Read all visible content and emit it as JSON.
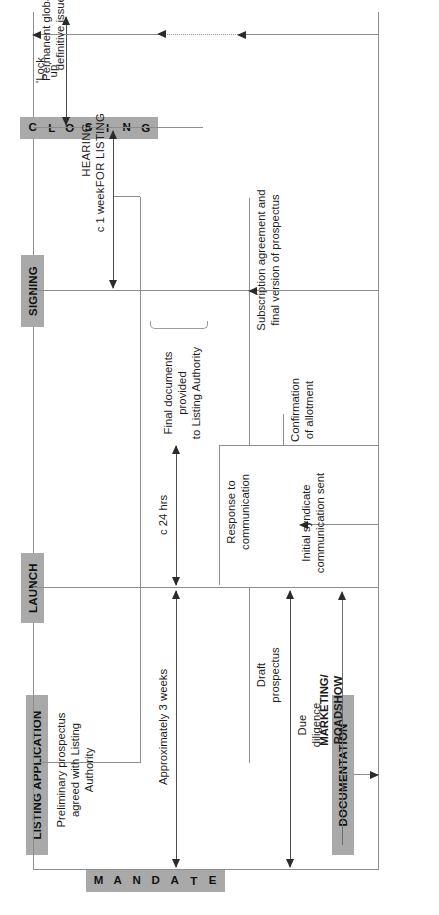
{
  "diagram": {
    "orientation": "rotated-90-ccw",
    "accent_gray": "#a9a9a9",
    "line_gray": "#8d8d8d",
    "phases": [
      {
        "id": "mandate",
        "label": "MANDATE",
        "style": "stacked-letters",
        "letters": [
          "M",
          "A",
          "N",
          "D",
          "A",
          "T",
          "E"
        ]
      },
      {
        "id": "launch",
        "label": "LAUNCH",
        "style": "horizontal"
      },
      {
        "id": "signing",
        "label": "SIGNING",
        "style": "horizontal"
      },
      {
        "id": "closing",
        "label": "CLOSING",
        "style": "stacked-letters",
        "letters": [
          "C",
          "L",
          "O",
          "S",
          "I",
          "N",
          "G"
        ]
      }
    ],
    "lanes": [
      {
        "id": "listing",
        "label": "LISTING APPLICATION"
      },
      {
        "id": "documentation",
        "label": "DOCUMENTATION"
      },
      {
        "id": "marketing",
        "label": "MARKETING/\nROADSHOW",
        "line1": "MARKETING/",
        "line2": "ROADSHOW"
      }
    ],
    "durations": [
      {
        "id": "approx-3-weeks",
        "label": "Approximately 3 weeks"
      },
      {
        "id": "c-24-hrs",
        "label": "c 24 hrs"
      },
      {
        "id": "c-1-week",
        "label": "c 1 week"
      },
      {
        "id": "lock-up",
        "label": "'Lock up'",
        "line1": "'Lock",
        "line2": "up'"
      }
    ],
    "annotations": [
      {
        "id": "hearing-for-listing",
        "line1": "HEARING",
        "line2": "FOR LISTING"
      },
      {
        "id": "preliminary-prospectus",
        "line1": "Preliminary prospectus",
        "line2": "agreed with Listing",
        "line3": "Authority"
      },
      {
        "id": "final-documents",
        "line1": "Final documents provided",
        "line2": "to Listing Authority"
      },
      {
        "id": "draft-prospectus",
        "line1": "Draft",
        "line2": "prospectus"
      },
      {
        "id": "due-diligence",
        "line1": "Due",
        "line2": "diligence"
      },
      {
        "id": "initial-syndicate",
        "line1": "Initial syndicate",
        "line2": "communication sent"
      },
      {
        "id": "response-to-communication",
        "line1": "Response to",
        "line2": "communication"
      },
      {
        "id": "confirmation-of-allotment",
        "line1": "Confirmation",
        "line2": "of allotment"
      },
      {
        "id": "subscription-agreement",
        "line1": "Subscription agreement and",
        "line2": "final version of prospectus"
      },
      {
        "id": "permanent-global",
        "line1": "Permanent global or",
        "line2": "definitive issued"
      }
    ]
  }
}
